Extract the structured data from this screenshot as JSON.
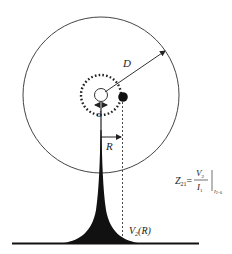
{
  "diagram": {
    "labels": {
      "outer_radius": "D",
      "inner_gap": "d",
      "radial_distance": "R",
      "voltage": "V",
      "voltage_sub": "2",
      "voltage_arg": "(R)"
    },
    "formula": {
      "lhs": "Z",
      "lhs_sub": "21",
      "equals": "=",
      "numerator": "V",
      "numerator_sub": "2",
      "denominator": "I",
      "denominator_sub": "1",
      "condition": "I",
      "condition_sub": "2=0"
    },
    "colors": {
      "stroke": "#333333",
      "fill": "#111111",
      "background": "#ffffff"
    }
  }
}
